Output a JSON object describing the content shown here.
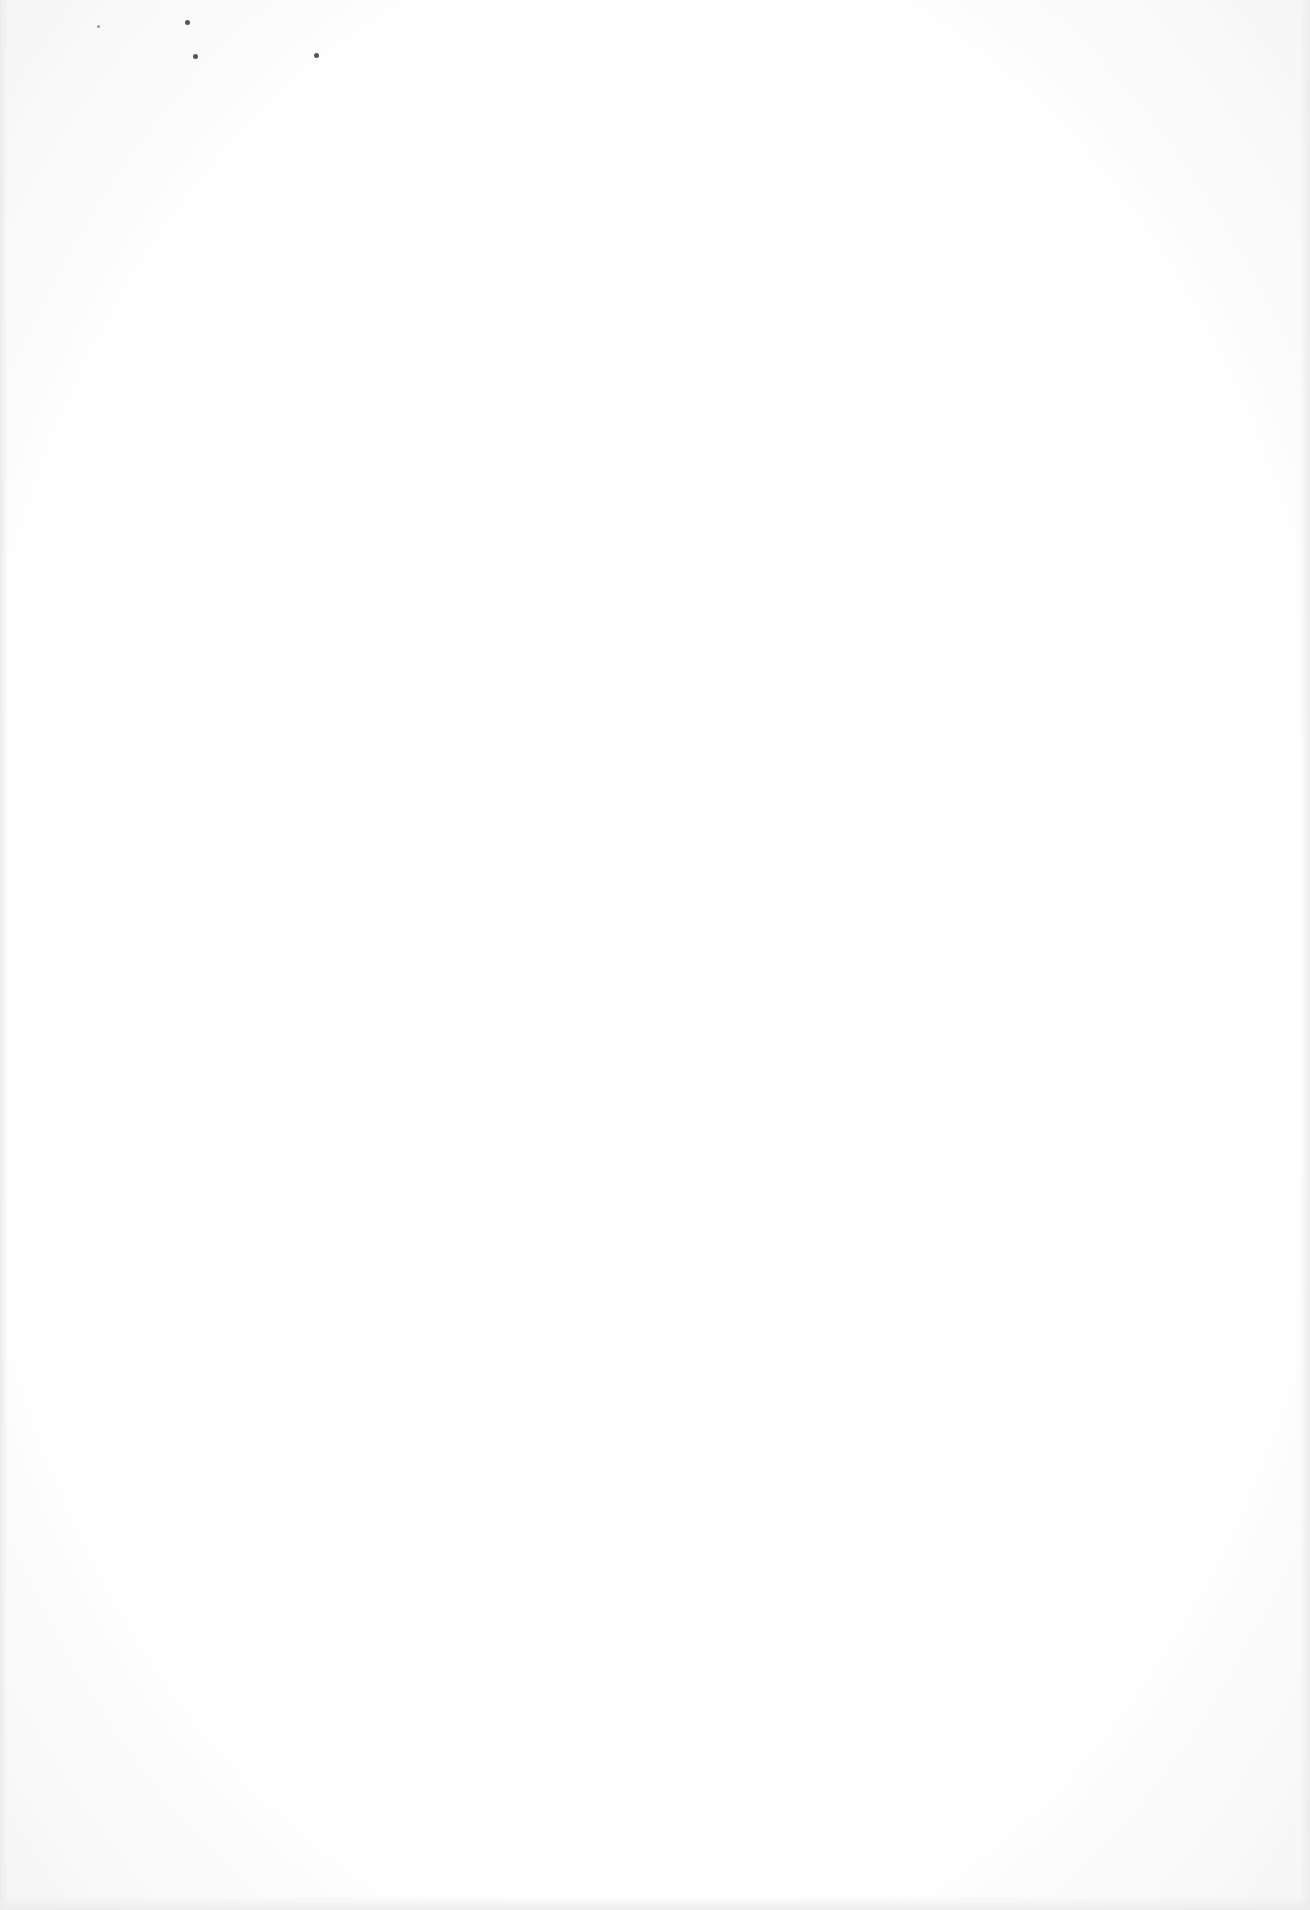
{
  "document": {
    "type": "blank scanned page",
    "bleed_through_text": "",
    "background_color": "#ffffff"
  }
}
